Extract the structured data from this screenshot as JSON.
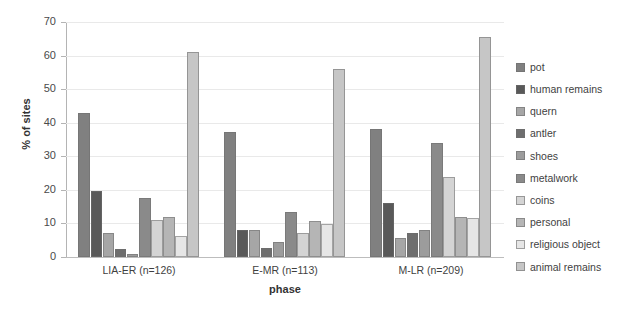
{
  "chart_data": {
    "type": "bar",
    "title": "",
    "xlabel": "phase",
    "ylabel": "% of sites",
    "ylim": [
      0,
      70
    ],
    "yticks": [
      0,
      10,
      20,
      30,
      40,
      50,
      60,
      70
    ],
    "grid": true,
    "legend_position": "right",
    "categories": [
      "LIA-ER (n=126)",
      "E-MR (n=113)",
      "M-LR (n=209)"
    ],
    "series": [
      {
        "name": "pot",
        "color": "#808080",
        "values": [
          42.9,
          37.2,
          38.1
        ]
      },
      {
        "name": "human remains",
        "color": "#595959",
        "values": [
          19.8,
          8.0,
          16.0
        ]
      },
      {
        "name": "quern",
        "color": "#a6a6a6",
        "values": [
          7.1,
          8.0,
          5.7
        ]
      },
      {
        "name": "antler",
        "color": "#6e6e6e",
        "values": [
          2.4,
          2.7,
          7.2
        ]
      },
      {
        "name": "shoes",
        "color": "#9c9c9c",
        "values": [
          0.8,
          4.4,
          8.1
        ]
      },
      {
        "name": "metalwork",
        "color": "#8a8a8a",
        "values": [
          17.5,
          13.3,
          34.0
        ]
      },
      {
        "name": "coins",
        "color": "#d4d4d4",
        "values": [
          11.1,
          7.1,
          23.9
        ]
      },
      {
        "name": "personal",
        "color": "#b5b5b5",
        "values": [
          12.0,
          10.6,
          12.0
        ]
      },
      {
        "name": "religious object",
        "color": "#e6e6e6",
        "values": [
          6.3,
          9.7,
          11.5
        ]
      },
      {
        "name": "animal remains",
        "color": "#c6c6c6",
        "values": [
          61.1,
          56.0,
          65.6
        ]
      }
    ]
  },
  "axis": {
    "y_title": "% of sites",
    "x_title": "phase",
    "y_tick_labels": [
      "0",
      "10",
      "20",
      "30",
      "40",
      "50",
      "60",
      "70"
    ],
    "x_tick_labels": [
      "LIA-ER (n=126)",
      "E-MR (n=113)",
      "M-LR (n=209)"
    ]
  },
  "legend": {
    "items": [
      {
        "label": "pot",
        "color": "#808080"
      },
      {
        "label": "human remains",
        "color": "#595959"
      },
      {
        "label": "quern",
        "color": "#a6a6a6"
      },
      {
        "label": "antler",
        "color": "#6e6e6e"
      },
      {
        "label": "shoes",
        "color": "#9c9c9c"
      },
      {
        "label": "metalwork",
        "color": "#8a8a8a"
      },
      {
        "label": "coins",
        "color": "#d4d4d4"
      },
      {
        "label": "personal",
        "color": "#b5b5b5"
      },
      {
        "label": "religious object",
        "color": "#e6e6e6"
      },
      {
        "label": "animal remains",
        "color": "#c6c6c6"
      }
    ]
  }
}
